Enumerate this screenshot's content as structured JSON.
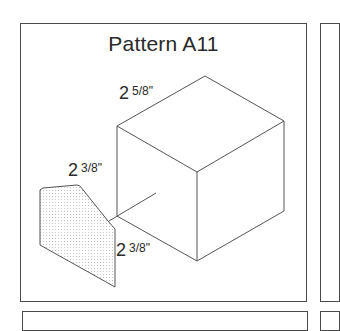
{
  "pattern": {
    "title": "Pattern A11",
    "dimensions": [
      {
        "id": "top-edge",
        "whole": "2",
        "fraction": "5/8\""
      },
      {
        "id": "height",
        "whole": "2",
        "fraction": "3/8\""
      },
      {
        "id": "depth",
        "whole": "2",
        "fraction": "3/8\""
      }
    ],
    "colors": {
      "frame": "#4a4a4a",
      "line": "#555555",
      "fill_dots": "#bdbdbd"
    }
  }
}
